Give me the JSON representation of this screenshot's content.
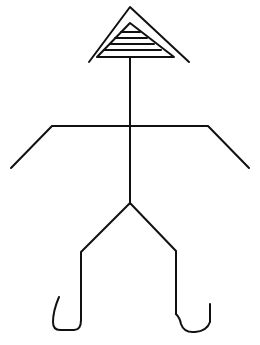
{
  "figure": {
    "stroke_color": "#111111",
    "background": "#ffffff",
    "parts": [
      "roof-head",
      "neck-body",
      "arms",
      "legs",
      "feet"
    ]
  }
}
